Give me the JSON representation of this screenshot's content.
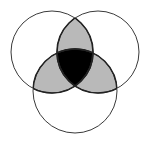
{
  "diagram": {
    "type": "venn",
    "sets": 3,
    "circles": [
      {
        "id": "A",
        "position": "top-left",
        "cx": 52,
        "cy": 52,
        "r": 41
      },
      {
        "id": "B",
        "position": "top-right",
        "cx": 98,
        "cy": 52,
        "r": 41
      },
      {
        "id": "C",
        "position": "bottom",
        "cx": 75,
        "cy": 91,
        "r": 42
      }
    ],
    "shaded_regions": [
      {
        "region": "A∩B only",
        "fill": "#b9b9b9"
      },
      {
        "region": "A∩C only",
        "fill": "#b9b9b9"
      },
      {
        "region": "B∩C only",
        "fill": "#b9b9b9"
      },
      {
        "region": "A∩B∩C",
        "fill": "#000000"
      }
    ],
    "colors": {
      "background": "#ffffff",
      "outline": "#3a3a3a",
      "pairwise": "#b9b9b9",
      "triple": "#000000"
    }
  }
}
